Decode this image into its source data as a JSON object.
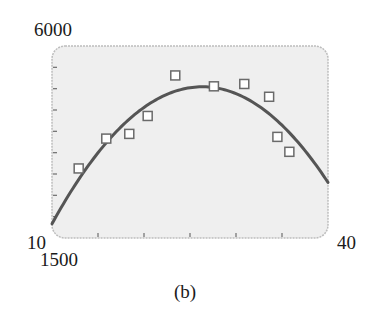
{
  "chart_data": {
    "type": "scatter",
    "title": "",
    "caption": "(b)",
    "xlabel": "",
    "ylabel": "",
    "xlim": [
      10,
      40
    ],
    "ylim": [
      1500,
      6000
    ],
    "x_ticks": [
      15,
      20,
      25,
      30,
      35
    ],
    "y_ticks": [
      2000,
      2500,
      3000,
      3500,
      4000,
      4500,
      5000,
      5500
    ],
    "grid": false,
    "legend": null,
    "corner_labels": {
      "y_max": "6000",
      "y_min": "1500",
      "x_min": "10",
      "x_max": "40"
    },
    "series": [
      {
        "name": "data",
        "kind": "scatter",
        "marker": "open-square",
        "x": [
          12.9,
          15.9,
          18.4,
          20.4,
          23.4,
          27.6,
          30.9,
          33.6,
          34.5,
          35.8
        ],
        "y": [
          3130,
          3830,
          3940,
          4360,
          5310,
          5055,
          5110,
          4810,
          3870,
          3520
        ]
      },
      {
        "name": "quadratic model",
        "kind": "line",
        "x": [
          10,
          13,
          16,
          19,
          22,
          25,
          27.2,
          30,
          33,
          36,
          40
        ],
        "y": [
          2016,
          2900,
          3640,
          4230,
          4680,
          4980,
          5080,
          5010,
          4700,
          4140,
          2510
        ]
      }
    ],
    "colors": {
      "plot_background": "#efefef",
      "frame": "#bdbdbd",
      "curve": "#555555",
      "marker_stroke": "#6a6a6a",
      "marker_fill": "#ffffff",
      "tick": "#777777"
    }
  }
}
